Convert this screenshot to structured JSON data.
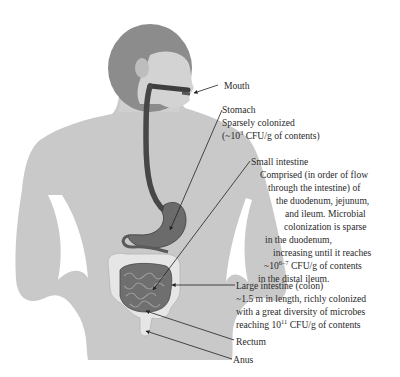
{
  "figure": {
    "colors": {
      "silhouette": "#c8c8c8",
      "hair": "#8a8a8a",
      "tract": "#4a4a4a",
      "colon": "#e4e4e4",
      "small_intestine": "#6c6c6c",
      "text": "#2a2a2a"
    }
  },
  "labels": {
    "mouth": {
      "title": "Mouth"
    },
    "stomach": {
      "title": "Stomach",
      "line1": "Sparsely colonized",
      "line2_pre": "(~10",
      "line2_sup": "3",
      "line2_post": " CFU/g of contents)"
    },
    "small_intestine": {
      "title": "Small intestine",
      "line1": "Comprised (in order of flow",
      "line2": "through the intestine) of",
      "line3": "the duodenum, jejunum,",
      "line4": "and ileum. Microbial",
      "line5": "colonization is sparse",
      "line6": "in the duodenum,",
      "line7": "increasing until it reaches",
      "line8_pre": "~10",
      "line8_sup": "6–7",
      "line8_post": " CFU/g of contents",
      "line9": "in the distal ileum."
    },
    "large_intestine": {
      "title": "Large intestine (colon)",
      "line1": "~1.5 m in length, richly colonized",
      "line2": "with a great diversity of microbes",
      "line3_pre": "reaching 10",
      "line3_sup": "11",
      "line3_post": " CFU/g of contents"
    },
    "rectum": {
      "title": "Rectum"
    },
    "anus": {
      "title": "Anus"
    }
  }
}
